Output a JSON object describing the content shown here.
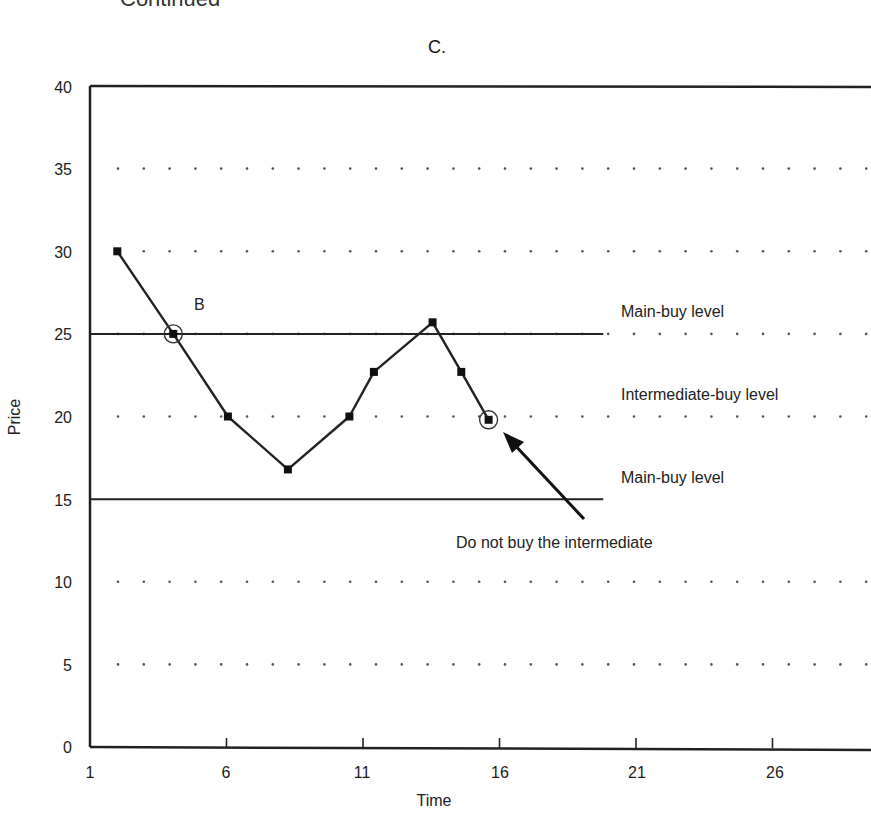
{
  "header": {
    "continued_label": "Continued",
    "panel_title": "C."
  },
  "chart_data": {
    "type": "line",
    "title": "C.",
    "xlabel": "Time",
    "ylabel": "Price",
    "xlim": [
      1,
      30
    ],
    "ylim": [
      0,
      40
    ],
    "x_ticks": [
      1,
      6,
      11,
      16,
      21,
      26
    ],
    "y_ticks": [
      0,
      5,
      10,
      15,
      20,
      25,
      30,
      35,
      40
    ],
    "grid": "dotted horizontal at 5, 10, 20, 25, 30, 35",
    "series": [
      {
        "name": "Price",
        "marker": "square",
        "x": [
          2.0,
          4.05,
          6.05,
          8.25,
          10.5,
          11.4,
          13.55,
          14.6,
          15.6
        ],
        "values": [
          30,
          25,
          20,
          16.8,
          20,
          22.7,
          25.7,
          22.7,
          19.8
        ]
      }
    ],
    "reference_lines": [
      {
        "label": "Main-buy level",
        "y": 25,
        "x_start": 1,
        "x_end": 19.8
      },
      {
        "label": "Main-buy level",
        "y": 15,
        "x_start": 1,
        "x_end": 19.8
      }
    ],
    "annotations": [
      {
        "text": "B",
        "x": 5.0,
        "y": 26.5,
        "note": "circled point at (4.05, 25)"
      },
      {
        "text": "Main-buy level",
        "x": 20,
        "y": 26.2
      },
      {
        "text": "Intermediate-buy level",
        "x": 20,
        "y": 21.2
      },
      {
        "text": "Main-buy level",
        "x": 20,
        "y": 16.2
      },
      {
        "text": "Do not buy the intermediate",
        "x": 14,
        "y": 12.4,
        "arrow_to": [
          15.8,
          19.2
        ]
      }
    ]
  },
  "labels": {
    "b": "B",
    "main_buy_upper": "Main-buy level",
    "intermediate": "Intermediate-buy level",
    "main_buy_lower": "Main-buy level",
    "do_not_buy": "Do not buy the intermediate",
    "xlabel": "Time",
    "ylabel": "Price",
    "y_ticks": [
      "0",
      "5",
      "10",
      "15",
      "20",
      "25",
      "30",
      "35",
      "40"
    ],
    "x_ticks": [
      "1",
      "6",
      "11",
      "16",
      "21",
      "26"
    ]
  },
  "colors": {
    "line": "#222222",
    "marker": "#111111",
    "grid_dot": "#555555",
    "axis": "#222222"
  }
}
